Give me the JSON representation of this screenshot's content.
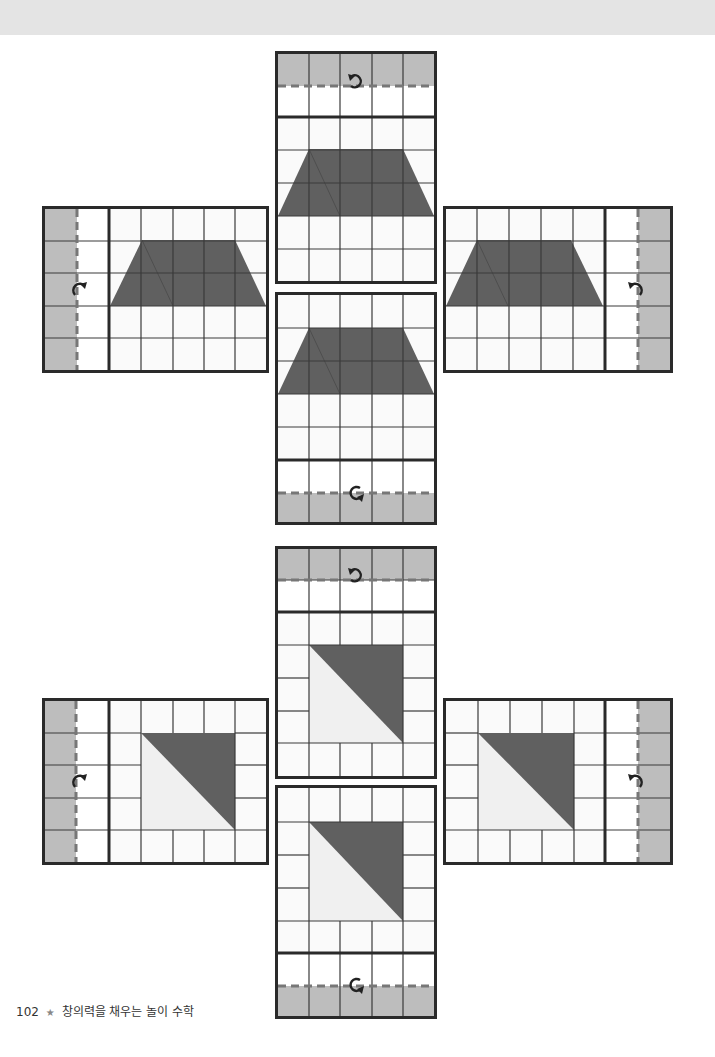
{
  "page": {
    "page_number": "102",
    "separator": "★",
    "book_title": "창의력을 채우는 놀이 수학"
  },
  "colors": {
    "grid_line": "#3a3a3a",
    "border": "#2a2a2a",
    "shape_dark": "#606060",
    "shape_light": "#f0f0f0",
    "flap_fill": "#bdbdbd",
    "fold_line": "#777777",
    "background": "#ffffff",
    "header_band": "#e4e4e4"
  },
  "puzzles": [
    {
      "name": "trapezoid-set",
      "shape": "trapezoid",
      "fold_icon": "rotate-arrow"
    },
    {
      "name": "triangle-set",
      "shape": "right-triangle",
      "fold_icon": "rotate-arrow"
    }
  ]
}
